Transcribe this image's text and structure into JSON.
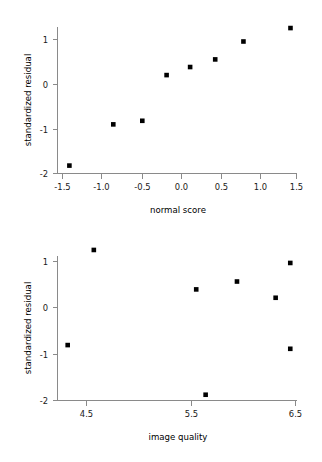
{
  "figure": {
    "background_color": "#ffffff",
    "marker_color": "#000000",
    "axis_color": "#8a8a8a",
    "marker_shape": "square"
  },
  "chart_data": [
    {
      "type": "scatter",
      "title": "",
      "xlabel": "normal score",
      "ylabel": "standardized residual",
      "xlim": [
        -1.72,
        1.66
      ],
      "ylim": [
        -2.1,
        1.45
      ],
      "xticks": [
        -1.5,
        -1.0,
        -0.5,
        0.0,
        0.5,
        1.0,
        1.5
      ],
      "xticklabels": [
        "-1.5",
        "-1.0",
        "-0.5",
        "0.0",
        "0.5",
        "1.0",
        "1.5"
      ],
      "yticks": [
        1,
        0,
        -1,
        -2
      ],
      "yticklabels": [
        "1",
        "0",
        "-1",
        "-2"
      ],
      "grid": false,
      "legend": "none",
      "x": [
        -1.43,
        -0.87,
        -0.5,
        -0.19,
        0.11,
        0.43,
        0.79,
        1.39
      ],
      "y": [
        -1.81,
        -0.89,
        -0.81,
        0.21,
        0.39,
        0.56,
        0.96,
        1.26
      ]
    },
    {
      "type": "scatter",
      "title": "",
      "xlabel": "image quality",
      "ylabel": "standardized residual",
      "xlim": [
        4.21,
        6.6
      ],
      "ylim": [
        -2.1,
        1.45
      ],
      "xticks": [
        4.5,
        5.5,
        6.5
      ],
      "xticklabels": [
        "4.5",
        "5.5",
        "6.5"
      ],
      "yticks": [
        1,
        0,
        -1,
        -2
      ],
      "yticklabels": [
        "1",
        "0",
        "-1",
        "-2"
      ],
      "grid": false,
      "legend": "none",
      "x": [
        4.32,
        4.57,
        5.55,
        5.64,
        5.94,
        6.31,
        6.45,
        6.45
      ],
      "y": [
        -0.81,
        1.24,
        0.39,
        -1.88,
        0.56,
        0.21,
        0.96,
        -0.89
      ]
    }
  ],
  "panels": [
    {
      "name": "normal-probability-plot",
      "xlabel": "normal score",
      "ylabel": "standardized residual"
    },
    {
      "name": "residual-vs-image-quality-plot",
      "xlabel": "image quality",
      "ylabel": "standardized residual"
    }
  ]
}
